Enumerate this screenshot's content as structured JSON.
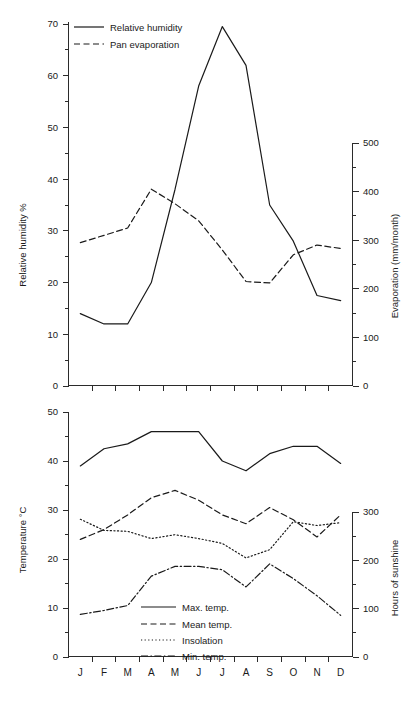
{
  "chart_data": [
    {
      "type": "line",
      "panel": "top",
      "title": "",
      "categories": [
        "J",
        "F",
        "M",
        "A",
        "M",
        "J",
        "J",
        "A",
        "S",
        "O",
        "N",
        "D"
      ],
      "xlabel": "",
      "ylabel": "Relative humidity %",
      "ylim": [
        0,
        70
      ],
      "yticks": [
        0,
        10,
        20,
        30,
        40,
        50,
        60,
        70
      ],
      "y2label": "Evaporation (mm/month)",
      "y2lim": [
        0,
        500
      ],
      "y2ticks": [
        0,
        100,
        200,
        300,
        400,
        500
      ],
      "grid": false,
      "legend_position": "top-left",
      "series": [
        {
          "name": "Relative humidity",
          "style": "solid",
          "axis": "left",
          "unit": "%",
          "values": [
            14,
            12,
            12,
            20,
            38,
            58,
            69.5,
            62,
            35,
            28,
            17.5,
            16.5
          ]
        },
        {
          "name": "Pan evaporation",
          "style": "dashed",
          "axis": "right",
          "unit": "mm/month",
          "values": [
            295,
            310,
            325,
            405,
            375,
            340,
            280,
            215,
            212,
            270,
            290,
            283
          ]
        }
      ]
    },
    {
      "type": "line",
      "panel": "bottom",
      "title": "",
      "categories": [
        "J",
        "F",
        "M",
        "A",
        "M",
        "J",
        "J",
        "A",
        "S",
        "O",
        "N",
        "D"
      ],
      "xlabel": "",
      "ylabel": "Temperature °C",
      "ylim": [
        0,
        50
      ],
      "yticks": [
        0,
        10,
        20,
        30,
        40,
        50
      ],
      "y2label": "Hours of sunshine",
      "y2lim": [
        0,
        300
      ],
      "y2ticks": [
        0,
        100,
        200,
        300
      ],
      "grid": false,
      "legend_position": "bottom-center",
      "series": [
        {
          "name": "Max. temp.",
          "style": "solid",
          "axis": "left",
          "unit": "°C",
          "values": [
            39,
            42.5,
            43.5,
            46,
            46,
            46,
            40,
            38,
            41.5,
            43,
            43,
            39.5
          ]
        },
        {
          "name": "Mean temp.",
          "style": "dashed",
          "axis": "left",
          "unit": "°C",
          "values": [
            24,
            26,
            29,
            32.5,
            34,
            32,
            29,
            27.2,
            30.5,
            28,
            24.5,
            29
          ]
        },
        {
          "name": "Insolation",
          "style": "dotted",
          "axis": "right",
          "unit": "hours",
          "values": [
            285,
            262,
            260,
            245,
            253,
            245,
            235,
            205,
            222,
            280,
            272,
            278
          ]
        },
        {
          "name": "Min. temp.",
          "style": "dash-dot",
          "axis": "left",
          "unit": "°C",
          "values": [
            8.7,
            9.5,
            10.5,
            16.5,
            18.5,
            18.5,
            17.8,
            14.3,
            19,
            16,
            12.5,
            8.5
          ]
        }
      ]
    }
  ],
  "top_panel": {
    "y_axis": {
      "label": "Relative humidity %",
      "ticks": [
        "0",
        "10",
        "20",
        "30",
        "40",
        "50",
        "60",
        "70"
      ]
    },
    "y2_axis": {
      "label": "Evaporation (mm/month)",
      "ticks": [
        "0",
        "100",
        "200",
        "300",
        "400",
        "500"
      ]
    },
    "legend": [
      {
        "label": "Relative humidity",
        "style": "solid"
      },
      {
        "label": "Pan evaporation",
        "style": "dashed"
      }
    ]
  },
  "bottom_panel": {
    "y_axis": {
      "label": "Temperature °C",
      "ticks": [
        "0",
        "10",
        "20",
        "30",
        "40",
        "50"
      ]
    },
    "y2_axis": {
      "label": "Hours of sunshine",
      "ticks": [
        "0",
        "100",
        "200",
        "300"
      ]
    },
    "x_axis": {
      "labels": [
        "J",
        "F",
        "M",
        "A",
        "M",
        "J",
        "J",
        "A",
        "S",
        "O",
        "N",
        "D"
      ]
    },
    "legend": [
      {
        "label": "Max. temp.",
        "style": "solid"
      },
      {
        "label": "Mean temp.",
        "style": "dashed"
      },
      {
        "label": "Insolation",
        "style": "dotted"
      },
      {
        "label": "Min. temp.",
        "style": "dash-dot"
      }
    ]
  },
  "colors": {
    "ink": "#1a1a1a",
    "axis": "#2b2b2b",
    "background": "#ffffff"
  }
}
